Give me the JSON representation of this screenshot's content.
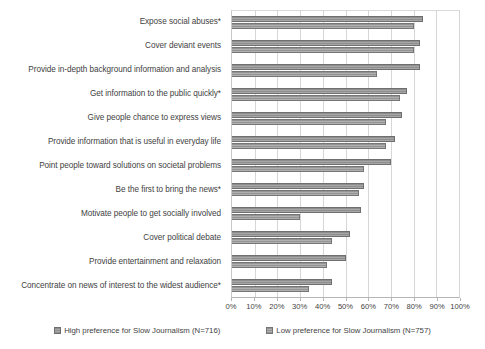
{
  "chart_data": {
    "type": "bar",
    "orientation": "horizontal",
    "title": "",
    "xlabel": "",
    "ylabel": "",
    "xlim": [
      0,
      100
    ],
    "xtick_labels": [
      "0%",
      "10%",
      "20%",
      "30%",
      "40%",
      "50%",
      "60%",
      "70%",
      "80%",
      "90%",
      "100%"
    ],
    "xtick_values": [
      0,
      10,
      20,
      30,
      40,
      50,
      60,
      70,
      80,
      90,
      100
    ],
    "grid": true,
    "legend_position": "bottom",
    "categories": [
      "Expose social abuses*",
      "Cover deviant events",
      "Provide in-depth background information and analysis",
      "Get information to the public quickly*",
      "Give people chance to express views",
      "Provide information that is useful in everyday life",
      "Point people toward solutions on societal problems",
      "Be the first to bring the news*",
      "Motivate people to get socially involved",
      "Cover political debate",
      "Provide entertainment and relaxation",
      "Concentrate on news of interest to the widest audience*"
    ],
    "series": [
      {
        "name": "High preference for Slow Journalism (N=716)",
        "color": "#8e8e8e",
        "values": [
          84,
          83,
          83,
          77,
          75,
          72,
          70,
          58,
          57,
          52,
          50,
          44
        ]
      },
      {
        "name": "Low preference for Slow Journalism (N=757)",
        "color": "#949494",
        "values": [
          80,
          80,
          64,
          74,
          68,
          68,
          58,
          56,
          30,
          44,
          42,
          34
        ]
      }
    ]
  },
  "legend": {
    "items": [
      {
        "label": "High preference for Slow Journalism (N=716)"
      },
      {
        "label": "Low preference for Slow Journalism (N=757)"
      }
    ]
  }
}
